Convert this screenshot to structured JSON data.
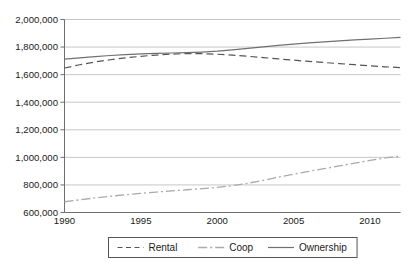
{
  "chart_data": {
    "type": "line",
    "title": "",
    "subtitle": "",
    "xlabel": "",
    "ylabel": "",
    "grid": true,
    "legend_position": "bottom",
    "xlim": [
      1990,
      2012
    ],
    "ylim": [
      600000,
      2000000
    ],
    "x": [
      1990,
      1991,
      1992,
      1993,
      1994,
      1995,
      1996,
      1997,
      1998,
      1999,
      2000,
      2001,
      2002,
      2003,
      2004,
      2005,
      2006,
      2007,
      2008,
      2009,
      2010,
      2011,
      2012
    ],
    "xticks": [
      1990,
      1995,
      2000,
      2005,
      2010
    ],
    "xtick_labels": [
      "1990",
      "1995",
      "2000",
      "2005",
      "2010"
    ],
    "yticks": [
      600000,
      800000,
      1000000,
      1200000,
      1400000,
      1600000,
      1800000,
      2000000
    ],
    "ytick_labels": [
      "600,000",
      "800,000",
      "1,000,000",
      "1,200,000",
      "1,400,000",
      "1,600,000",
      "1,800,000",
      "2,000,000"
    ],
    "series": [
      {
        "name": "Rental",
        "style": "dashed",
        "color": "#555555",
        "values": [
          1648000,
          1672000,
          1692000,
          1708000,
          1722000,
          1733000,
          1742000,
          1749000,
          1753000,
          1752000,
          1748000,
          1741000,
          1733000,
          1724000,
          1714000,
          1705000,
          1696000,
          1688000,
          1680000,
          1672000,
          1664000,
          1657000,
          1651000
        ]
      },
      {
        "name": "Coop",
        "style": "dash-dot",
        "color": "#aaaaaa",
        "values": [
          678000,
          692000,
          706000,
          718000,
          729000,
          739000,
          748000,
          757000,
          765000,
          773000,
          782000,
          795000,
          812000,
          833000,
          856000,
          878000,
          899000,
          918000,
          938000,
          958000,
          978000,
          996000,
          1010000
        ]
      },
      {
        "name": "Ownership",
        "style": "solid",
        "color": "#707070",
        "values": [
          1712000,
          1722000,
          1731000,
          1739000,
          1745000,
          1750000,
          1754000,
          1757000,
          1760000,
          1764000,
          1770000,
          1779000,
          1790000,
          1801000,
          1812000,
          1821000,
          1830000,
          1838000,
          1845000,
          1852000,
          1858000,
          1864000,
          1870000
        ]
      }
    ]
  },
  "legend": {
    "items": [
      {
        "label": "Rental"
      },
      {
        "label": "Coop"
      },
      {
        "label": "Ownership"
      }
    ]
  }
}
